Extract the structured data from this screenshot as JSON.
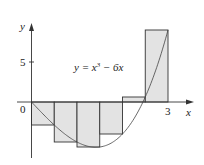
{
  "chart_data": {
    "type": "bar",
    "title": "",
    "function_label": "y = x³ − 6x",
    "xlabel": "x",
    "ylabel": "y",
    "x_tick_labels": [
      "0",
      "3"
    ],
    "y_tick_labels": [
      "5"
    ],
    "xlim": [
      0,
      3
    ],
    "ylim": [
      -6,
      10
    ],
    "categories": [
      "[0,0.5]",
      "[0.5,1]",
      "[1,1.5]",
      "[1.5,2]",
      "[2,2.5]",
      "[2.5,3]"
    ],
    "x_left": [
      0,
      0.5,
      1,
      1.5,
      2,
      2.5
    ],
    "values": [
      -2.875,
      -5,
      -5.625,
      -4,
      0.625,
      9
    ],
    "grid": false
  },
  "labels": {
    "y_axis": "y",
    "x_axis": "x",
    "origin": "0",
    "y_tick_5": "5",
    "x_tick_3": "3",
    "equation_prefix": "y = x",
    "equation_exp": "3",
    "equation_suffix": " − 6x"
  }
}
